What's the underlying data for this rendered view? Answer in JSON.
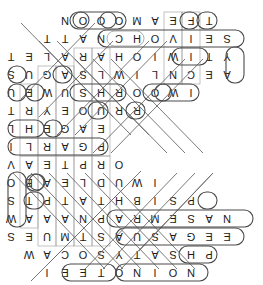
{
  "puzzle": {
    "title": "Pizza Toppings Word Search",
    "orientation_degrees": 180,
    "grid_columns": 15,
    "grid_rows": 15,
    "cell_size_px": 18,
    "origin_x_px": 9,
    "origin_y_px": 3,
    "ink_color": "#1b1b1b",
    "oval_color": "#4a4a4a",
    "line_color": "#6a6a6a",
    "background_color": "#ffffff",
    "rows": [
      [
        "",
        "",
        "",
        "N",
        "O",
        "I",
        "N",
        "O",
        "T",
        "E",
        "E",
        "I",
        "",
        "",
        ""
      ],
      [
        "",
        "",
        "P",
        "H",
        "S",
        "A",
        "T",
        "Y",
        "S",
        "O",
        "C",
        "A",
        "W",
        "",
        ""
      ],
      [
        "",
        "E",
        "E",
        "G",
        "A",
        "S",
        "U",
        "A",
        "S",
        "T",
        "M",
        "U",
        "E",
        "S",
        ""
      ],
      [
        "",
        "N",
        "A",
        "S",
        "E",
        "M",
        "R",
        "A",
        "P",
        "N",
        "A",
        "A",
        "A",
        "W",
        "I"
      ],
      [
        "",
        "",
        "",
        "P",
        "S",
        "I",
        "B",
        "H",
        "T",
        "A",
        "T",
        "P",
        "T",
        "S",
        "L"
      ],
      [
        "",
        "",
        "",
        "",
        "",
        "I",
        "W",
        "U",
        "D",
        "L",
        "E",
        "A",
        "B",
        "O",
        "O"
      ],
      [
        "",
        "",
        "",
        "",
        "",
        "",
        "",
        "O",
        "R",
        "P",
        "T",
        "E",
        "A",
        "V",
        "C"
      ],
      [
        "",
        "",
        "",
        "",
        "",
        "",
        "",
        "",
        "P",
        "G",
        "A",
        "R",
        "L",
        "I",
        "C"
      ],
      [
        "",
        "",
        "",
        "",
        "",
        "",
        "",
        "",
        "E",
        "A",
        "G",
        "E",
        "H",
        "L",
        "C"
      ],
      [
        "",
        "",
        "",
        "",
        "",
        "",
        "R",
        "R",
        "U",
        "O",
        "E",
        "Y",
        "R",
        "T",
        "R"
      ],
      [
        "",
        "",
        "",
        "I",
        "W",
        "O",
        "O",
        "R",
        "H",
        "S",
        "U",
        "W",
        "E",
        "U",
        "B"
      ],
      [
        "",
        "A",
        "E",
        "C",
        "N",
        "L",
        "I",
        "W",
        "L",
        "S",
        "A",
        "G",
        "U",
        "S",
        "O"
      ],
      [
        "",
        "Y",
        "T",
        "I",
        "W",
        "I",
        "O",
        "H",
        "A",
        "R",
        "A",
        "L",
        "E",
        "T",
        ""
      ],
      [
        "",
        "S",
        "E",
        "I",
        "V",
        "O",
        "H",
        "C",
        "N",
        "A",
        "T",
        "T",
        "",
        "",
        ""
      ],
      [
        "",
        "",
        "T",
        "F",
        "E",
        "A",
        "M",
        "O",
        "O",
        "O",
        "N",
        "",
        "",
        "",
        ""
      ]
    ],
    "found_words": [
      {
        "word": "ONION",
        "direction": "horizontal"
      },
      {
        "word": "SAUSAGE",
        "direction": "horizontal"
      },
      {
        "word": "PARMESAN",
        "direction": "horizontal"
      },
      {
        "word": "GARLIC",
        "direction": "horizontal"
      },
      {
        "word": "MUSHROOM",
        "direction": "horizontal"
      },
      {
        "word": "ANCHOVIES",
        "direction": "horizontal"
      },
      {
        "word": "TOMATO",
        "direction": "horizontal"
      },
      {
        "word": "BASIL",
        "direction": "vertical"
      },
      {
        "word": "OLIVE",
        "direction": "vertical"
      },
      {
        "word": "CHEESE",
        "direction": "diagonal"
      },
      {
        "word": "PEPPER",
        "direction": "diagonal"
      },
      {
        "word": "BACON",
        "direction": "diagonal"
      }
    ]
  }
}
